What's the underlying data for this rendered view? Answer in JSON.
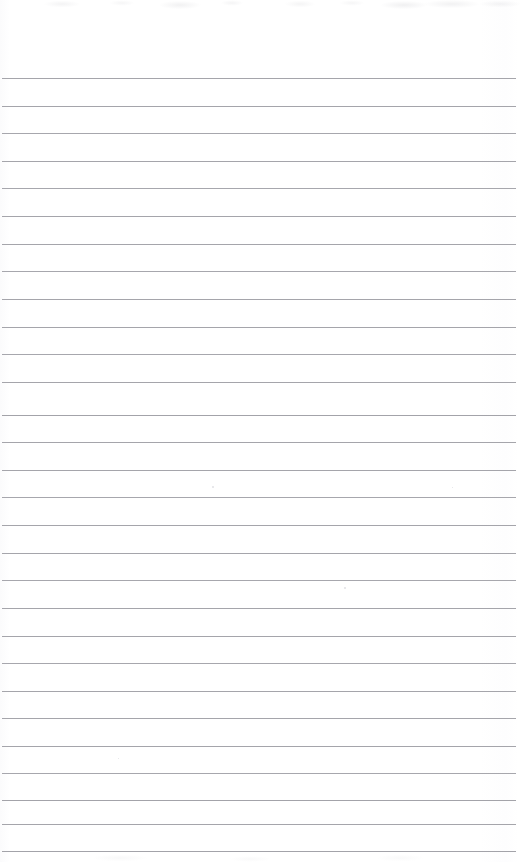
{
  "document": {
    "kind": "scanned-ruled-notepad-page",
    "title": "Blank Ruled Notepad Page",
    "page_width": 524,
    "page_height": 862,
    "paper_color": "#ffffff",
    "rule_color": "#9b9ba2",
    "written_content": "",
    "visible_text": "",
    "notes": "No text, headings, numbers, or handwriting are present on the page."
  },
  "ruling": {
    "line_count": 29,
    "first_line_y": 78,
    "line_spacing": 27.6,
    "line_thickness": 1,
    "line_start_x": 2,
    "line_end_x": 516,
    "lines": [
      {
        "y": 78,
        "x1": 2,
        "x2": 516,
        "opacity": 0.9
      },
      {
        "y": 106,
        "x1": 2,
        "x2": 516,
        "opacity": 0.9
      },
      {
        "y": 133,
        "x1": 2,
        "x2": 516,
        "opacity": 0.88
      },
      {
        "y": 161,
        "x1": 2,
        "x2": 516,
        "opacity": 0.9
      },
      {
        "y": 188,
        "x1": 2,
        "x2": 516,
        "opacity": 0.88
      },
      {
        "y": 216,
        "x1": 2,
        "x2": 516,
        "opacity": 0.9
      },
      {
        "y": 244,
        "x1": 2,
        "x2": 516,
        "opacity": 0.9
      },
      {
        "y": 271,
        "x1": 2,
        "x2": 516,
        "opacity": 0.88
      },
      {
        "y": 299,
        "x1": 2,
        "x2": 516,
        "opacity": 0.9
      },
      {
        "y": 327,
        "x1": 2,
        "x2": 516,
        "opacity": 0.9
      },
      {
        "y": 354,
        "x1": 2,
        "x2": 516,
        "opacity": 0.88
      },
      {
        "y": 382,
        "x1": 2,
        "x2": 516,
        "opacity": 0.9
      },
      {
        "y": 415,
        "x1": 2,
        "x2": 516,
        "opacity": 0.92
      },
      {
        "y": 442,
        "x1": 2,
        "x2": 516,
        "opacity": 0.9
      },
      {
        "y": 470,
        "x1": 2,
        "x2": 516,
        "opacity": 0.9
      },
      {
        "y": 497,
        "x1": 2,
        "x2": 516,
        "opacity": 0.88
      },
      {
        "y": 525,
        "x1": 2,
        "x2": 516,
        "opacity": 0.9
      },
      {
        "y": 553,
        "x1": 2,
        "x2": 516,
        "opacity": 0.9
      },
      {
        "y": 580,
        "x1": 2,
        "x2": 516,
        "opacity": 0.88
      },
      {
        "y": 608,
        "x1": 2,
        "x2": 516,
        "opacity": 0.9
      },
      {
        "y": 636,
        "x1": 2,
        "x2": 516,
        "opacity": 0.9
      },
      {
        "y": 663,
        "x1": 2,
        "x2": 516,
        "opacity": 0.88
      },
      {
        "y": 691,
        "x1": 2,
        "x2": 516,
        "opacity": 0.9
      },
      {
        "y": 718,
        "x1": 2,
        "x2": 516,
        "opacity": 0.9
      },
      {
        "y": 746,
        "x1": 2,
        "x2": 516,
        "opacity": 0.9
      },
      {
        "y": 773,
        "x1": 2,
        "x2": 516,
        "opacity": 0.88
      },
      {
        "y": 800,
        "x1": 2,
        "x2": 516,
        "opacity": 0.92
      },
      {
        "y": 824,
        "x1": 2,
        "x2": 516,
        "opacity": 0.9
      },
      {
        "y": 851,
        "x1": 2,
        "x2": 516,
        "opacity": 0.92
      }
    ]
  },
  "artifacts": {
    "specks": [
      {
        "x": 212,
        "y": 486,
        "size": 2
      },
      {
        "x": 344,
        "y": 587,
        "size": 2
      },
      {
        "x": 452,
        "y": 487,
        "size": 1
      },
      {
        "x": 118,
        "y": 758,
        "size": 1
      }
    ]
  }
}
